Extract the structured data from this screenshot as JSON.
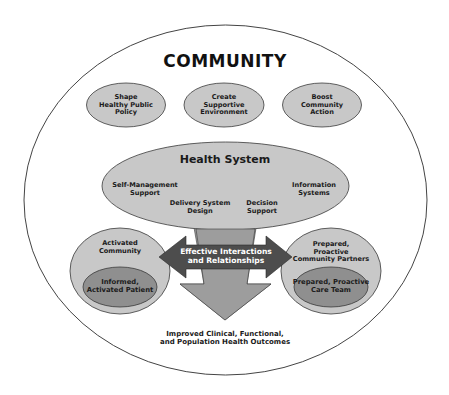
{
  "diagram": {
    "title": "COMMUNITY",
    "community_policies": [
      {
        "label": "Shape\nHealthy Public\nPolicy"
      },
      {
        "label": "Create\nSupportive\nEnvironment"
      },
      {
        "label": "Boost\nCommunity\nAction"
      }
    ],
    "health_system": {
      "title": "Health System",
      "components": [
        {
          "label": "Self-Management\nSupport"
        },
        {
          "label": "Delivery System\nDesign"
        },
        {
          "label": "Decision\nSupport"
        },
        {
          "label": "Information\nSystems"
        }
      ]
    },
    "left_group": {
      "outer": "Activated\nCommunity",
      "inner": "Informed,\nActivated Patient"
    },
    "right_group": {
      "outer": "Prepared,\nProactive\nCommunity Partners",
      "inner": "Prepared, Proactive\nCare Team"
    },
    "interaction_arrow": "Effective Interactions\nand Relationships",
    "outcome": "Improved Clinical, Functional,\nand Population Health Outcomes"
  },
  "colors": {
    "ellipse_fill": "#c8c8c8",
    "inner_fill": "#8f8f8f",
    "arrow_fill": "#4d4d4d",
    "down_arrow_fill": "#9d9d9d",
    "stroke": "#3a3a3a"
  }
}
